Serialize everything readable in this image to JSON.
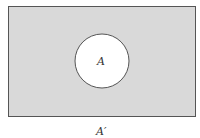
{
  "diagram": {
    "type": "venn",
    "universal_set": {
      "shaded": true,
      "fill": "#d9d9d9",
      "stroke": "#555555"
    },
    "set_a": {
      "label": "A",
      "fill": "#ffffff",
      "stroke": "#555555"
    },
    "caption": "A′"
  }
}
